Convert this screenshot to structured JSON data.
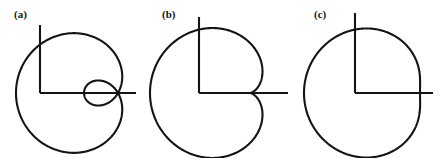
{
  "figure": {
    "background_color": "#ffffff",
    "stroke_color": "#141414",
    "label_color": "#161616",
    "width": 448,
    "height": 158
  },
  "panels": [
    {
      "id": "panel-a",
      "label": "(a)",
      "label_x": 14,
      "label_y": 8,
      "curve_name": "limacon-with-inner-loop",
      "equation": "r = a + b cos(theta), b > a",
      "origin_x": 118,
      "origin_y": 93,
      "scale": 1.0,
      "a": 34,
      "b": 68,
      "orientation": "opens-left",
      "axis": {
        "vertical_x": 40,
        "vertical_top_y": 25,
        "vertical_bottom_y": 93,
        "horizontal_y": 93,
        "horizontal_left_x": 40,
        "horizontal_right_x": 136
      }
    },
    {
      "id": "panel-b",
      "label": "(b)",
      "label_x": 162,
      "label_y": 8,
      "curve_name": "cardioid",
      "equation": "r = a + b cos(theta), b = a",
      "origin_x": 250,
      "origin_y": 93,
      "scale": 1.0,
      "a": 50,
      "b": 50,
      "orientation": "opens-left",
      "axis": {
        "vertical_x": 199,
        "vertical_top_y": 17,
        "vertical_bottom_y": 93,
        "horizontal_y": 93,
        "horizontal_left_x": 199,
        "horizontal_right_x": 288
      }
    },
    {
      "id": "panel-c",
      "label": "(c)",
      "label_x": 314,
      "label_y": 8,
      "curve_name": "dimpled-limacon",
      "equation": "r = a + b cos(theta), a < b < 2a",
      "origin_x": 393,
      "origin_y": 93,
      "scale": 1.0,
      "a": 58,
      "b": 31,
      "orientation": "opens-left",
      "axis": {
        "vertical_x": 355,
        "vertical_top_y": 13,
        "vertical_bottom_y": 93,
        "horizontal_y": 93,
        "horizontal_left_x": 355,
        "horizontal_right_x": 433
      }
    }
  ],
  "chart_data": {
    "type": "line",
    "title": "",
    "subtitle": "",
    "xlabel": "",
    "ylabel": "",
    "grid": false,
    "legend": "none",
    "series": [
      {
        "name": "(a) limacon with inner loop",
        "a": 34,
        "b": 68,
        "condition": "b > 2a",
        "r_max": 102,
        "r_min": -34
      },
      {
        "name": "(b) cardioid",
        "a": 50,
        "b": 50,
        "condition": "b = a",
        "r_max": 100,
        "r_min": 0
      },
      {
        "name": "(c) dimpled limacon",
        "a": 58,
        "b": 31,
        "condition": "a < b < 2a",
        "r_max": 89,
        "r_min": 27
      }
    ]
  }
}
